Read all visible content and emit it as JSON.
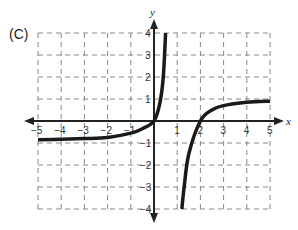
{
  "problem_label": "(C)",
  "chart_data": {
    "type": "line",
    "title": "",
    "xlabel": "x",
    "ylabel": "y",
    "xlim": [
      -5,
      5
    ],
    "ylim": [
      -4,
      4
    ],
    "grid": true,
    "grid_style": "dashed",
    "x_ticks": [
      "-5",
      "-4",
      "-3",
      "-2",
      "-1",
      "1",
      "2",
      "3",
      "4",
      "5"
    ],
    "y_ticks": [
      "4",
      "3",
      "2",
      "1",
      "-1",
      "-2",
      "-3",
      "-4"
    ],
    "series": [
      {
        "name": "left branch",
        "points": [
          [
            -5,
            -0.85
          ],
          [
            -4,
            -0.83
          ],
          [
            -3,
            -0.8
          ],
          [
            -2,
            -0.75
          ],
          [
            -1,
            -0.55
          ],
          [
            -0.5,
            -0.35
          ],
          [
            0,
            0
          ],
          [
            0.25,
            0.8
          ],
          [
            0.4,
            2
          ],
          [
            0.5,
            4
          ]
        ]
      },
      {
        "name": "right branch",
        "points": [
          [
            1.2,
            -4
          ],
          [
            1.3,
            -3
          ],
          [
            1.5,
            -1.5
          ],
          [
            2,
            0
          ],
          [
            2.5,
            0.5
          ],
          [
            3,
            0.7
          ],
          [
            4,
            0.85
          ],
          [
            5,
            0.9
          ]
        ]
      }
    ],
    "curve_color": "#1a1a1a"
  }
}
